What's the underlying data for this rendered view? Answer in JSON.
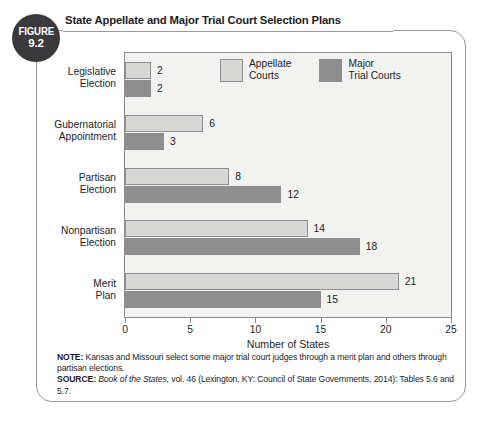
{
  "figure": {
    "badge_word": "FIGURE",
    "badge_number": "9.2",
    "title": "State Appellate and Major Trial Court Selection Plans"
  },
  "legend": {
    "entries": [
      {
        "label": "Appellate\nCourts",
        "color": "#d7d7d5",
        "series": "Appellate Courts"
      },
      {
        "label": "Major\nTrial Courts",
        "color": "#8e8e8e",
        "series": "Major Trial Courts"
      }
    ]
  },
  "notes": {
    "note_label": "NOTE:",
    "note_text": " Kansas and Missouri select some major trial court judges through a merit plan and others through partisan elections.",
    "source_label": "SOURCE:",
    "source_italic": " Book of the States,",
    "source_rest": " vol. 46 (Lexington, KY: Council of State Governments, 2014): Tables 5.6 and 5.7."
  },
  "chart_data": {
    "type": "bar",
    "orientation": "horizontal",
    "title": "State Appellate and Major Trial Court Selection Plans",
    "xlabel": "Number of States",
    "ylabel": "",
    "xlim": [
      0,
      25
    ],
    "xticks": [
      0,
      5,
      10,
      15,
      20,
      25
    ],
    "xtick_labels": [
      "0",
      "5",
      "10",
      "15",
      "20",
      "25"
    ],
    "grid": false,
    "legend_position": "top-center-inside",
    "categories": [
      "Legislative\nElection",
      "Gubernatorial\nAppointment",
      "Partisan\nElection",
      "Nonpartisan\nElection",
      "Merit\nPlan"
    ],
    "series": [
      {
        "name": "Appellate Courts",
        "color": "#d7d7d5",
        "values": [
          2,
          6,
          8,
          14,
          21
        ],
        "value_labels": [
          "2",
          "6",
          "8",
          "14",
          "21"
        ]
      },
      {
        "name": "Major Trial Courts",
        "color": "#8e8e8e",
        "values": [
          2,
          3,
          12,
          18,
          15
        ],
        "value_labels": [
          "2",
          "3",
          "12",
          "18",
          "15"
        ]
      }
    ]
  }
}
